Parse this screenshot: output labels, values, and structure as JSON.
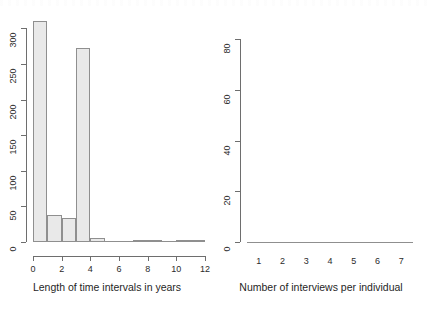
{
  "figure": {
    "background": "#ffffff",
    "bar_fill": "#e9e9e9",
    "bar_border": "#8f8f8f",
    "axis_color": "#6e6e6e"
  },
  "chart_data": [
    {
      "type": "bar",
      "panel": "left",
      "title": "",
      "xlabel": "Length of time intervals in years",
      "ylabel": "",
      "grid": false,
      "legend": false,
      "xlim": [
        0,
        12
      ],
      "ylim": [
        0,
        320
      ],
      "xticks": [
        0,
        2,
        4,
        6,
        8,
        10,
        12
      ],
      "xticklabels": [
        "0",
        "2",
        "4",
        "6",
        "8",
        "10",
        "12"
      ],
      "yticks": [
        0,
        50,
        100,
        150,
        200,
        250,
        300
      ],
      "yticklabels": [
        "0",
        "50",
        "100",
        "150",
        "200",
        "250",
        "300"
      ],
      "bin_edges": [
        0,
        1,
        2,
        3,
        4,
        5,
        6,
        7,
        8,
        9,
        10,
        11,
        12
      ],
      "categories": [
        "0-1",
        "1-2",
        "2-3",
        "3-4",
        "4-5",
        "5-6",
        "6-7",
        "7-8",
        "8-9",
        "9-10",
        "10-11",
        "11-12"
      ],
      "values": [
        310,
        38,
        34,
        273,
        5,
        0,
        0,
        1,
        1,
        0,
        2,
        1
      ]
    },
    {
      "type": "bar",
      "panel": "right",
      "title": "",
      "xlabel": "Number of interviews per individual",
      "ylabel": "",
      "grid": false,
      "legend": false,
      "ylim": [
        0,
        90
      ],
      "yticks": [
        0,
        20,
        40,
        60,
        80
      ],
      "yticklabels": [
        "0",
        "20",
        "40",
        "60",
        "80"
      ],
      "categories": [
        "1",
        "2",
        "3",
        "4",
        "5",
        "6",
        "7"
      ],
      "values": [
        86,
        52,
        18,
        19,
        7,
        11,
        41
      ]
    }
  ]
}
